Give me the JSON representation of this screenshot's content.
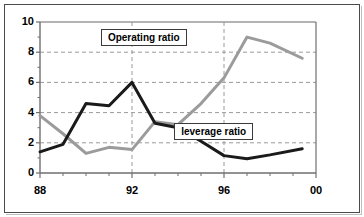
{
  "chart_data": {
    "type": "line",
    "title": "",
    "xlabel": "",
    "ylabel": "",
    "xlim": [
      88,
      100
    ],
    "ylim": [
      0,
      10
    ],
    "yticks": [
      0,
      2,
      4,
      6,
      8,
      10
    ],
    "ytick_labels": [
      "0",
      "2",
      "4",
      "6",
      "8",
      "10"
    ],
    "y_minor_ticks": [
      1,
      3,
      5,
      7,
      9
    ],
    "xticks": [
      88,
      92,
      96,
      100
    ],
    "xtick_labels": [
      "88",
      "92",
      "96",
      "00"
    ],
    "x_minor_ticks": [
      89,
      90,
      91,
      93,
      94,
      95,
      97,
      98,
      99
    ],
    "grid": true,
    "grid_style": "dashed",
    "grid_color": "#9a9a9a",
    "legend_position": "inline-boxed-annotations",
    "x": [
      88,
      89,
      90,
      91,
      92,
      93,
      94,
      95,
      96,
      97,
      98,
      99.4
    ],
    "series": [
      {
        "name": "leverage ratio",
        "color": "#1a1a1a",
        "line_width": 3,
        "values": [
          1.4,
          1.9,
          4.6,
          4.45,
          6.0,
          3.3,
          3.0,
          2.1,
          1.15,
          0.95,
          1.2,
          1.6
        ]
      },
      {
        "name": "Operating ratio",
        "color": "#9b9b9b",
        "line_width": 3,
        "values": [
          3.8,
          2.6,
          1.3,
          1.7,
          1.55,
          3.4,
          3.2,
          4.6,
          6.3,
          9.0,
          8.6,
          7.6
        ]
      }
    ],
    "annotations": [
      {
        "text": "Operating ratio",
        "x": 92.3,
        "y": 9.0
      },
      {
        "text": "leverage ratio",
        "x": 95.4,
        "y": 2.75
      }
    ]
  },
  "axis": {
    "y_labels": [
      "10",
      "8",
      "6",
      "4",
      "2",
      "0"
    ],
    "x_labels": [
      "88",
      "92",
      "96",
      "00"
    ]
  },
  "labels": {
    "operating_ratio": "Operating ratio",
    "leverage_ratio": "leverage ratio"
  },
  "colors": {
    "leverage_line": "#1a1a1a",
    "operating_line": "#9b9b9b",
    "grid": "#9a9a9a",
    "axis": "#6f6f6f",
    "frame": "#4a4a4a",
    "background": "#ffffff"
  }
}
